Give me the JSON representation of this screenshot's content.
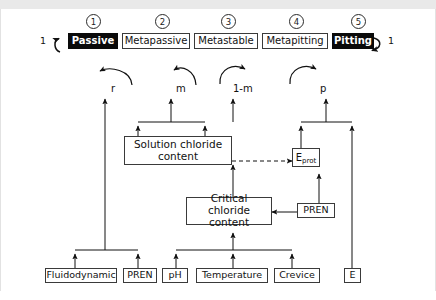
{
  "diagram": {
    "states": [
      {
        "index": "1",
        "label": "Passive",
        "filled": true
      },
      {
        "index": "2",
        "label": "Metapassive",
        "filled": false
      },
      {
        "index": "3",
        "label": "Metastable",
        "filled": false
      },
      {
        "index": "4",
        "label": "Metapitting",
        "filled": false
      },
      {
        "index": "5",
        "label": "Pitting",
        "filled": true
      }
    ],
    "endpoints": {
      "left_probability": "1",
      "right_probability": "1"
    },
    "transition_labels": [
      "r",
      "m",
      "1-m",
      "p"
    ],
    "mid_nodes": [
      {
        "key": "solution_chloride",
        "line1": "Solution chloride",
        "line2": "content"
      },
      {
        "key": "critical_chloride",
        "line1": "Critical chloride",
        "line2": "content"
      }
    ],
    "eprot": {
      "symbol": "E",
      "subscript": "prot"
    },
    "pren_mid": "PREN",
    "factors": [
      {
        "key": "fluidodynamic",
        "label": "Fluidodynamic"
      },
      {
        "key": "pren",
        "label": "PREN"
      },
      {
        "key": "ph",
        "label": "pH"
      },
      {
        "key": "temperature",
        "label": "Temperature"
      },
      {
        "key": "crevice",
        "label": "Crevice"
      },
      {
        "key": "potential",
        "label": "E"
      }
    ],
    "colors": {
      "ink": "#111111",
      "filled_bg": "#0a0a0a",
      "filled_text": "#ffffff",
      "box_border": "#3a3a3a",
      "page_bg": "#ffffff",
      "scan_band": "#e9e9e9"
    }
  }
}
